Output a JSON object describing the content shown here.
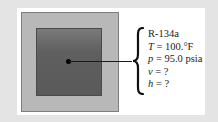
{
  "diagram": {
    "substance": "R-134a",
    "properties": [
      {
        "symbol": "T",
        "relation": " = ",
        "value": "100.°F"
      },
      {
        "symbol": "p",
        "relation": " = ",
        "value": "95.0 psia"
      },
      {
        "symbol": "v",
        "relation": " = ",
        "value": "?"
      },
      {
        "symbol": "h",
        "relation": " = ",
        "value": "?"
      }
    ],
    "colors": {
      "background": "#e4e4e4",
      "panel": "#ffffff",
      "outer_box": "#b8b8b8",
      "inner_box": "#5f5f5f",
      "dot": "#000000"
    }
  }
}
